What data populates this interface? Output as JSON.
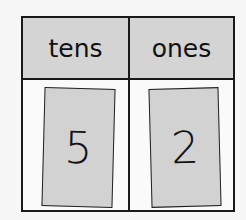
{
  "place_value_chart": {
    "headers": [
      "tens",
      "ones"
    ],
    "cards": [
      "5",
      "2"
    ],
    "colors": {
      "header_bg": "#d4d4d4",
      "card_bg": "#d2d2d2",
      "border": "#1a1a1a"
    }
  }
}
